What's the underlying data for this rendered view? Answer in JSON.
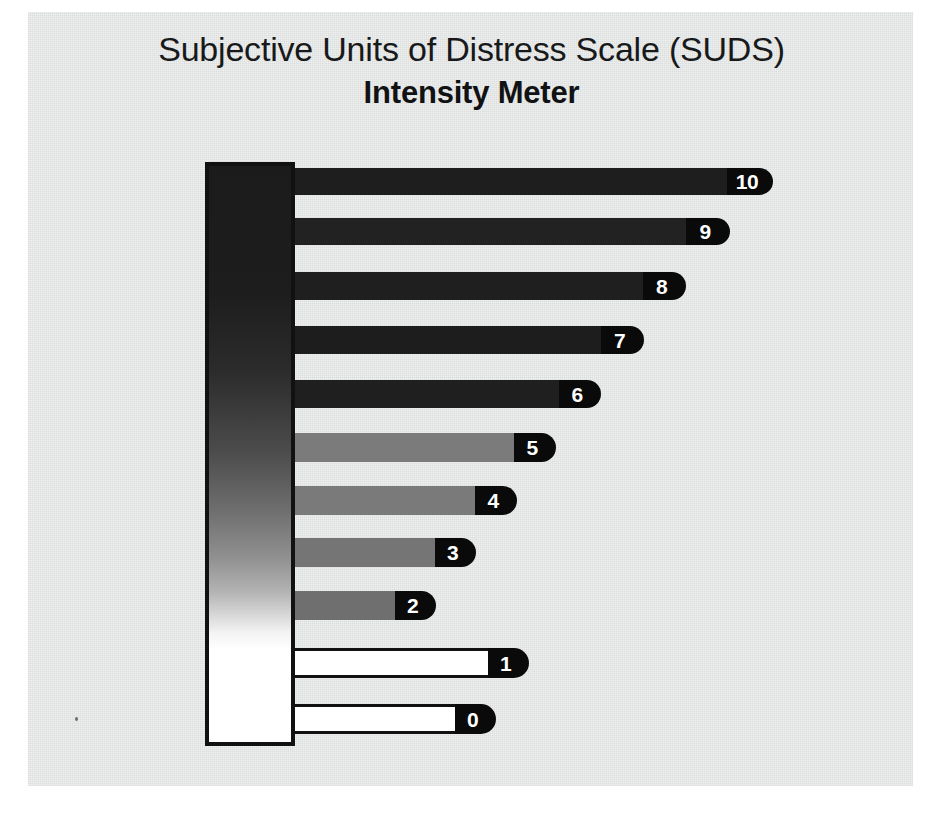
{
  "page": {
    "title_line_1": "Subjective Units of Distress Scale (SUDS)",
    "title_line_2": "Intensity Meter",
    "background_color": "#eceded",
    "ink_color": "#111111"
  },
  "chart_data": {
    "type": "bar",
    "orientation": "horizontal",
    "title": "Subjective Units of Distress Scale (SUDS) Intensity Meter",
    "subtitle": "Intensity Meter",
    "xlabel": "",
    "ylabel": "",
    "grid": false,
    "legend": false,
    "xlim": [
      0,
      10
    ],
    "categories": [
      "10",
      "9",
      "8",
      "7",
      "6",
      "5",
      "4",
      "3",
      "2",
      "1",
      "0"
    ],
    "values": [
      10,
      9,
      8,
      7,
      6,
      5,
      4,
      3,
      2,
      1,
      0
    ],
    "tick_labels": [
      "0",
      "1",
      "2",
      "3",
      "4",
      "5",
      "6",
      "7",
      "8",
      "9",
      "10"
    ],
    "gradient_scale": {
      "description": "vertical intensity gradient from black (high distress, 10) at top to white (no distress, 0) at bottom",
      "top_color": "#1b1b1b",
      "bottom_color": "#ffffff"
    },
    "bars": [
      {
        "label": "10",
        "value": 10,
        "length_px": 432,
        "cap_width_px": 46,
        "color": "#1e1e1e",
        "outlined": false,
        "top_px": 168,
        "height_px": 27
      },
      {
        "label": "9",
        "value": 9,
        "length_px": 391,
        "cap_width_px": 44,
        "color": "#222222",
        "outlined": false,
        "top_px": 218,
        "height_px": 27
      },
      {
        "label": "8",
        "value": 8,
        "length_px": 348,
        "cap_width_px": 43,
        "color": "#1f1f1f",
        "outlined": false,
        "top_px": 272,
        "height_px": 28
      },
      {
        "label": "7",
        "value": 7,
        "length_px": 306,
        "cap_width_px": 43,
        "color": "#1d1d1d",
        "outlined": false,
        "top_px": 326,
        "height_px": 28
      },
      {
        "label": "6",
        "value": 6,
        "length_px": 264,
        "cap_width_px": 42,
        "color": "#1f1f1f",
        "outlined": false,
        "top_px": 380,
        "height_px": 28
      },
      {
        "label": "5",
        "value": 5,
        "length_px": 219,
        "cap_width_px": 42,
        "color": "#7b7b7b",
        "outlined": false,
        "top_px": 433,
        "height_px": 29
      },
      {
        "label": "4",
        "value": 4,
        "length_px": 180,
        "cap_width_px": 42,
        "color": "#7a7a7a",
        "outlined": false,
        "top_px": 486,
        "height_px": 29
      },
      {
        "label": "3",
        "value": 3,
        "length_px": 140,
        "cap_width_px": 41,
        "color": "#757575",
        "outlined": false,
        "top_px": 538,
        "height_px": 29
      },
      {
        "label": "2",
        "value": 2,
        "length_px": 100,
        "cap_width_px": 41,
        "color": "#6f6f6f",
        "outlined": false,
        "top_px": 591,
        "height_px": 29
      },
      {
        "label": "1",
        "value": 1,
        "length_px": 193,
        "cap_width_px": 41,
        "color": "#ffffff",
        "outlined": true,
        "top_px": 648,
        "height_px": 30
      },
      {
        "label": "0",
        "value": 0,
        "length_px": 160,
        "cap_width_px": 41,
        "color": "#ffffff",
        "outlined": true,
        "top_px": 704,
        "height_px": 30
      }
    ]
  }
}
